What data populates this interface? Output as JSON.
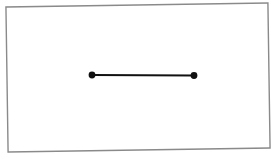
{
  "figure": {
    "background_color": "#ffffff",
    "width": 279,
    "height": 159,
    "frame": {
      "label": "border-rectangle",
      "stroke_color": "#8a8a8a",
      "fill_color": "#ffffff",
      "stroke_width": 1.4,
      "rotation_degrees": -0.85,
      "x": 7,
      "y": 5,
      "width": 262,
      "height": 145
    }
  },
  "chart_data": {
    "type": "scatter",
    "title": "",
    "subtitle": "",
    "xlabel": "",
    "ylabel": "",
    "grid": false,
    "legend": "none",
    "axis_visible": false,
    "tick_labels": [],
    "annotations": [],
    "xlim": [
      0,
      279
    ],
    "ylim": [
      0,
      159
    ],
    "shapes": [
      {
        "name": "line-segment",
        "type": "line",
        "x1": 92,
        "y1": 75,
        "x2": 194,
        "y2": 75.5,
        "length": 102,
        "color": "#111111",
        "stroke_width": 2.1
      }
    ],
    "points": [
      {
        "name": "left-endpoint",
        "x": 92,
        "y": 75,
        "radius": 3.4,
        "color": "#111111",
        "marker": "filled-circle"
      },
      {
        "name": "right-endpoint",
        "x": 194,
        "y": 75.5,
        "radius": 3.4,
        "color": "#111111",
        "marker": "filled-circle"
      }
    ]
  }
}
